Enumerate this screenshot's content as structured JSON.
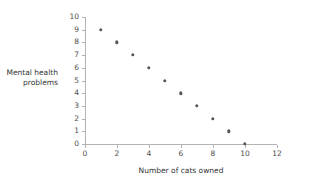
{
  "chart_data": {
    "type": "scatter",
    "title": "",
    "xlabel": "Number of cats owned",
    "ylabel": "Mental health problems",
    "ylabel_lines": [
      "Mental health",
      "problems"
    ],
    "x": [
      1,
      2,
      3,
      4,
      5,
      6,
      7,
      8,
      9,
      10
    ],
    "values": [
      9,
      8,
      7,
      6,
      5,
      4,
      3,
      2,
      1,
      0
    ],
    "series": [
      {
        "name": "Mental health problems",
        "x": [
          1,
          2,
          3,
          4,
          5,
          6,
          7,
          8,
          9,
          10
        ],
        "values": [
          9,
          8,
          7,
          6,
          5,
          4,
          3,
          2,
          1,
          0
        ]
      }
    ],
    "xlim": [
      0,
      12
    ],
    "ylim": [
      0,
      10
    ],
    "xticks": [
      0,
      2,
      4,
      6,
      8,
      10,
      12
    ],
    "yticks": [
      0,
      1,
      2,
      3,
      4,
      5,
      6,
      7,
      8,
      9,
      10
    ],
    "xtick_labels": [
      "0",
      "2",
      "4",
      "6",
      "8",
      "10",
      "12"
    ],
    "ytick_labels": [
      "0",
      "1",
      "2",
      "3",
      "4",
      "5",
      "6",
      "7",
      "8",
      "9",
      "10"
    ],
    "grid": false,
    "legend": false,
    "legend_position": "none",
    "marker_color": "#545454",
    "axis_color": "#b3b3b3",
    "text_color": "#333333",
    "tick_label_color": "#4d4d4d",
    "background_color": "#ffffff"
  }
}
